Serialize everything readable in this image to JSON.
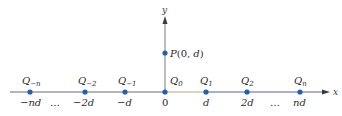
{
  "diagram": {
    "colors": {
      "axis": "#6a6a6a",
      "axis_right": "#5a5fa8",
      "axis_mid": "#b5a880",
      "dot": "#1f5fb5",
      "text": "#2a2a2a"
    },
    "axes": {
      "x_label": "x",
      "y_label": "y"
    },
    "point_p": {
      "label": "P(0, d)"
    },
    "charges": [
      {
        "name": "Q",
        "sub": "−n",
        "tick": "−nd"
      },
      {
        "name": "Q",
        "sub": "−2",
        "tick": "−2d"
      },
      {
        "name": "Q",
        "sub": "−1",
        "tick": "−d"
      },
      {
        "name": "Q",
        "sub": "0",
        "tick": "0"
      },
      {
        "name": "Q",
        "sub": "1",
        "tick": "d"
      },
      {
        "name": "Q",
        "sub": "2",
        "tick": "2d"
      },
      {
        "name": "Q",
        "sub": "n",
        "tick": "nd"
      }
    ],
    "ellipsis_left": "…",
    "ellipsis_right": "…"
  }
}
